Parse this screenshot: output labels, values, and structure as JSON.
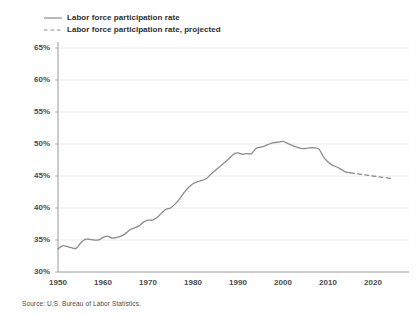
{
  "chart_data": {
    "type": "line",
    "title": "",
    "subtitle": "",
    "xlabel": "",
    "ylabel": "",
    "xlim": [
      1948,
      2024
    ],
    "ylim": [
      30,
      65
    ],
    "grid": true,
    "grid_axis": "y",
    "legend_position": "top-left",
    "y_tick_labels": [
      "65%",
      "60%",
      "55%",
      "50%",
      "45%",
      "40%",
      "35%",
      "30%"
    ],
    "y_ticks": [
      65,
      60,
      55,
      50,
      45,
      40,
      35,
      30
    ],
    "x_tick_labels": [
      "1950",
      "1960",
      "1970",
      "1980",
      "1990",
      "2000",
      "2010",
      "2020"
    ],
    "x_ticks": [
      1950,
      1960,
      1970,
      1980,
      1990,
      2000,
      2010,
      2020
    ],
    "series": [
      {
        "name": "Labor force participation rate",
        "style": "solid",
        "color": "#8c8c8c",
        "x": [
          1950,
          1951,
          1952,
          1953,
          1954,
          1955,
          1956,
          1957,
          1958,
          1959,
          1960,
          1961,
          1962,
          1963,
          1964,
          1965,
          1966,
          1967,
          1968,
          1969,
          1970,
          1971,
          1972,
          1973,
          1974,
          1975,
          1976,
          1977,
          1978,
          1979,
          1980,
          1981,
          1982,
          1983,
          1984,
          1985,
          1986,
          1987,
          1988,
          1989,
          1990,
          1991,
          1992,
          1993,
          1994,
          1995,
          1996,
          1997,
          1998,
          1999,
          2000,
          2001,
          2002,
          2003,
          2004,
          2005,
          2006,
          2007,
          2008,
          2009,
          2010,
          2011,
          2012,
          2013,
          2014,
          2015
        ],
        "values": [
          33.6,
          33.9,
          33.8,
          33.6,
          33.7,
          34.4,
          35.0,
          35.0,
          34.9,
          34.9,
          35.2,
          35.3,
          35.1,
          35.2,
          35.4,
          35.8,
          36.4,
          36.8,
          37.1,
          37.7,
          38.0,
          38.0,
          38.4,
          39.0,
          39.6,
          39.8,
          40.3,
          41.1,
          42.0,
          42.8,
          43.4,
          43.8,
          44.0,
          44.3,
          44.9,
          45.4,
          46.0,
          46.5,
          47.0,
          47.6,
          47.9,
          47.7,
          47.8,
          47.8,
          48.3,
          48.5,
          48.7,
          49.0,
          49.2,
          49.3,
          49.4,
          49.2,
          48.9,
          48.6,
          48.3,
          48.3,
          48.3,
          48.3,
          48.1,
          47.0,
          46.3,
          45.9,
          45.7,
          45.3,
          44.8,
          44.7
        ],
        "note": "Rate shown on 30-65% scale; values above are percent of population in labor force."
      },
      {
        "name": "Labor force participation rate, projected",
        "style": "dashed",
        "color": "#8c8c8c",
        "x": [
          2015,
          2016,
          2017,
          2018,
          2019,
          2020,
          2021,
          2022,
          2023,
          2024
        ],
        "values": [
          44.7,
          44.6,
          44.5,
          44.4,
          44.3,
          44.2,
          44.1,
          44.0,
          43.9,
          43.8
        ]
      }
    ],
    "series_display": {
      "observed_points": [
        [
          1950,
          33.6
        ],
        [
          1951,
          34.1
        ],
        [
          1952,
          34.0
        ],
        [
          1953,
          33.8
        ],
        [
          1954,
          33.7
        ],
        [
          1955,
          34.5
        ],
        [
          1956,
          35.1
        ],
        [
          1957,
          35.1
        ],
        [
          1958,
          35.0
        ],
        [
          1959,
          35.0
        ],
        [
          1960,
          35.4
        ],
        [
          1961,
          35.6
        ],
        [
          1962,
          35.3
        ],
        [
          1963,
          35.4
        ],
        [
          1964,
          35.6
        ],
        [
          1965,
          36.0
        ],
        [
          1966,
          36.6
        ],
        [
          1967,
          36.9
        ],
        [
          1968,
          37.2
        ],
        [
          1969,
          37.8
        ],
        [
          1970,
          38.1
        ],
        [
          1971,
          38.1
        ],
        [
          1972,
          38.5
        ],
        [
          1973,
          39.2
        ],
        [
          1974,
          39.8
        ],
        [
          1975,
          40.0
        ],
        [
          1976,
          40.6
        ],
        [
          1977,
          41.4
        ],
        [
          1978,
          42.4
        ],
        [
          1979,
          43.2
        ],
        [
          1980,
          43.8
        ],
        [
          1981,
          44.1
        ],
        [
          1982,
          44.3
        ],
        [
          1983,
          44.6
        ],
        [
          1984,
          45.3
        ],
        [
          1985,
          45.9
        ],
        [
          1986,
          46.5
        ],
        [
          1987,
          47.1
        ],
        [
          1988,
          47.7
        ],
        [
          1989,
          48.4
        ],
        [
          1990,
          48.6
        ],
        [
          1991,
          48.4
        ],
        [
          1992,
          48.5
        ],
        [
          1993,
          48.5
        ],
        [
          1994,
          49.3
        ],
        [
          1995,
          49.5
        ],
        [
          1996,
          49.7
        ],
        [
          1997,
          50.0
        ],
        [
          1998,
          50.2
        ],
        [
          1999,
          50.3
        ],
        [
          2000,
          50.4
        ],
        [
          2001,
          50.1
        ],
        [
          2002,
          49.8
        ],
        [
          2003,
          49.5
        ],
        [
          2004,
          49.3
        ],
        [
          2005,
          49.3
        ],
        [
          2006,
          49.4
        ],
        [
          2007,
          49.4
        ],
        [
          2008,
          49.2
        ],
        [
          2009,
          48.0
        ],
        [
          2010,
          47.2
        ],
        [
          2011,
          46.7
        ],
        [
          2012,
          46.4
        ],
        [
          2013,
          46.0
        ],
        [
          2014,
          45.6
        ],
        [
          2015,
          45.5
        ]
      ],
      "projected_points": [
        [
          2015,
          45.5
        ],
        [
          2017,
          45.3
        ],
        [
          2019,
          45.1
        ],
        [
          2021,
          44.9
        ],
        [
          2022,
          44.8
        ],
        [
          2024,
          44.6
        ]
      ]
    }
  },
  "legend": {
    "items": [
      {
        "label": "Labor force participation rate",
        "style": "solid",
        "icon": "solid-line-icon"
      },
      {
        "label": "Labor force participation rate, projected",
        "style": "dashed",
        "icon": "dashed-line-icon"
      }
    ]
  },
  "source": {
    "text": "Source: U.S. Bureau of Labor Statistics."
  },
  "colors": {
    "line": "#8c8c8c",
    "axis": "#9a9a9a",
    "grid": "#e6e6e6",
    "text": "#4a4a4a",
    "legend_text": "#2e2e2e",
    "background": "#ffffff"
  }
}
